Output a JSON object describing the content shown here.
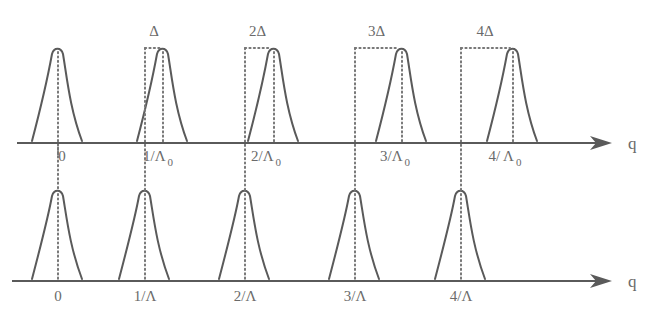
{
  "diagram": {
    "axis_label": "q",
    "top_row": {
      "axis": {
        "y": 143,
        "x_start": 17,
        "x_end": 612
      },
      "peaks": [
        {
          "label": "0",
          "subscript": "",
          "ref_x": 58,
          "peak_x": 58,
          "shift_label": "",
          "label_x": 62
        },
        {
          "label": "1/Λ",
          "subscript": "0",
          "ref_x": 145,
          "peak_x": 163,
          "shift_label": "Δ",
          "label_x": 158
        },
        {
          "label": "2/Λ",
          "subscript": "0",
          "ref_x": 245,
          "peak_x": 274,
          "shift_label": "2Δ",
          "label_x": 266
        },
        {
          "label": "3/Λ",
          "subscript": "0",
          "ref_x": 355,
          "peak_x": 402,
          "shift_label": "3Δ",
          "label_x": 395
        },
        {
          "label": "4/ Λ",
          "subscript": "0",
          "ref_x": 461,
          "peak_x": 513,
          "shift_label": "4Δ",
          "label_x": 505
        }
      ]
    },
    "bottom_row": {
      "axis": {
        "y": 281,
        "x_start": 12,
        "x_end": 612
      },
      "peaks": [
        {
          "label": "0",
          "x": 58
        },
        {
          "label": "1/Λ",
          "x": 145
        },
        {
          "label": "2/Λ",
          "x": 245
        },
        {
          "label": "3/Λ",
          "x": 355
        },
        {
          "label": "4/Λ",
          "x": 461
        }
      ]
    },
    "colors": {
      "line": "#5a5a5a",
      "dots": "#777777",
      "text": "#6a6a6a"
    }
  }
}
